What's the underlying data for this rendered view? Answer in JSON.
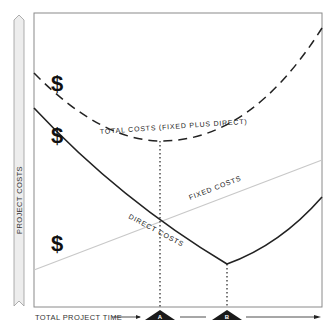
{
  "diagram": {
    "y_axis_label": "PROJECT COSTS",
    "x_axis_label": "TOTAL PROJECT TIME",
    "curves": {
      "total_costs": {
        "label": "TOTAL COSTS (FIXED PLUS DIRECT)",
        "style": "dashed",
        "color": "#222222"
      },
      "fixed_costs": {
        "label": "FIXED COSTS",
        "style": "solid-thin",
        "color": "#c8c8c8"
      },
      "direct_costs": {
        "label": "DIRECT COSTS",
        "style": "solid",
        "color": "#222222"
      }
    },
    "currency_symbols": [
      "$",
      "$",
      "$"
    ],
    "markers": [
      {
        "label": "A",
        "meaning": "minimum total cost point"
      },
      {
        "label": "B",
        "meaning": "minimum direct cost point"
      }
    ],
    "colors": {
      "frame": "#8a8a8a",
      "ribbon_fill": "#ededed",
      "ribbon_stroke": "#9a9a9a",
      "marker_fill": "#1a1a1a"
    }
  }
}
